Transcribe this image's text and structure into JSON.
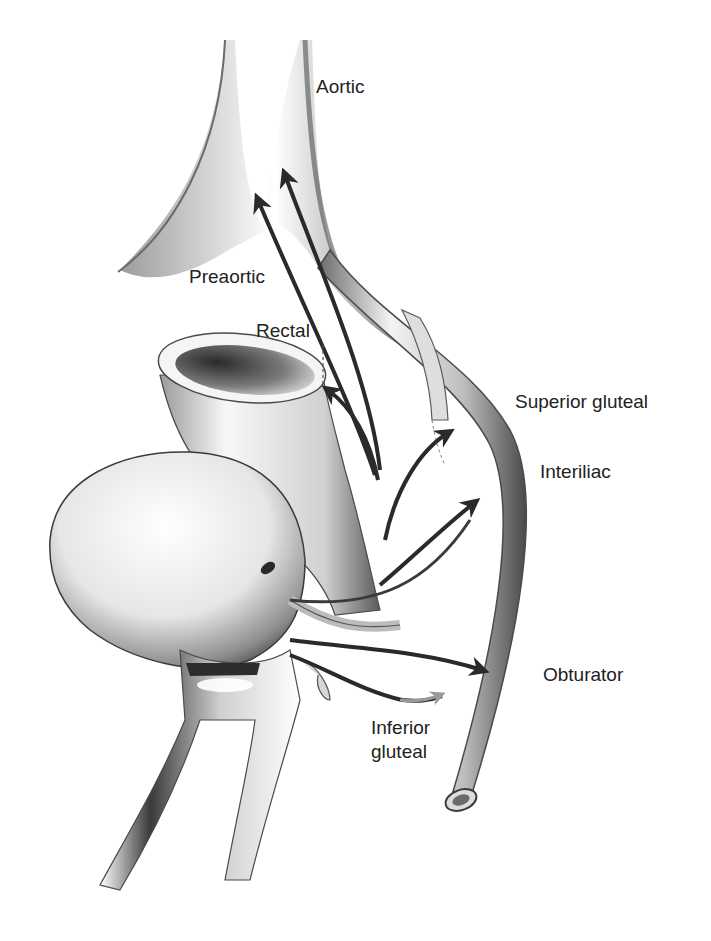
{
  "figure": {
    "type": "anatomical-illustration",
    "colors": {
      "background": "#ffffff",
      "vessel_light": "#f2f2f2",
      "vessel_mid": "#b9b9b9",
      "vessel_dark": "#555555",
      "arrow_dark": "#2a2a2a",
      "arrow_light": "#9a9a9a",
      "label_text": "#222222"
    }
  },
  "labels": {
    "aortic": "Aortic",
    "preaortic": "Preaortic",
    "rectal": "Rectal",
    "superior_gluteal": "Superior gluteal",
    "interiliac": "Interiliac",
    "obturator": "Obturator",
    "inferior_gluteal_line1": "Inferior",
    "inferior_gluteal_line2": "gluteal"
  }
}
